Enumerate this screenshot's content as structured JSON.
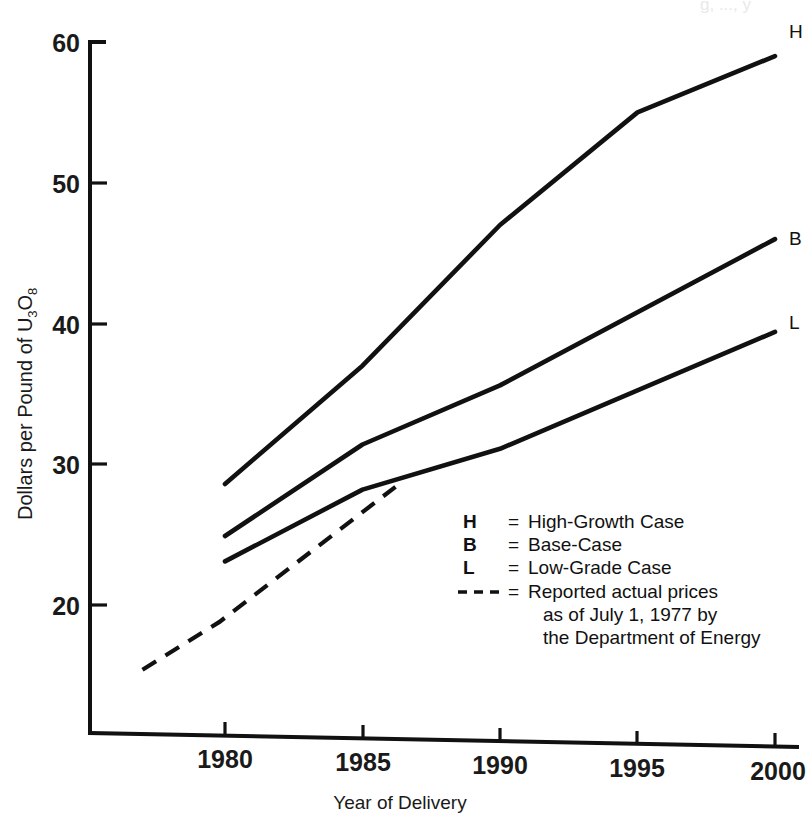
{
  "chart_data": {
    "type": "line",
    "title": "",
    "xlabel": "Year of Delivery",
    "ylabel": "Dollars per Pound of U3O8",
    "ylabel_parts": {
      "prefix": "Dollars per Pound of U",
      "sub1": "3",
      "mid": "O",
      "sub2": "8"
    },
    "xlim": [
      1977,
      2000
    ],
    "ylim": [
      14.5,
      60
    ],
    "xticks": [
      1980,
      1985,
      1990,
      1995,
      2000
    ],
    "xtick_labels": [
      "1980",
      "1985",
      "1990",
      "1995",
      "2000"
    ],
    "yticks": [
      20,
      30,
      40,
      50,
      60
    ],
    "ytick_labels": [
      "20",
      "30",
      "40",
      "50",
      "60"
    ],
    "grid": false,
    "legend_position": "inside-lower-right",
    "series": [
      {
        "name": "H",
        "label": "H",
        "x": [
          1980,
          1985,
          1990,
          1995,
          2000
        ],
        "values": [
          28.6,
          37.0,
          47.0,
          55.0,
          59.0
        ]
      },
      {
        "name": "B",
        "label": "B",
        "x": [
          1980,
          1985,
          1990,
          2000
        ],
        "values": [
          24.9,
          31.4,
          35.6,
          46.0
        ]
      },
      {
        "name": "L",
        "label": "L",
        "x": [
          1980,
          1985,
          1990,
          2000
        ],
        "values": [
          23.1,
          28.2,
          31.1,
          39.4
        ]
      },
      {
        "name": "Reported actual prices",
        "label": "",
        "style": "dashed",
        "x": [
          1977,
          1979.8,
          1986.2
        ],
        "values": [
          15.4,
          18.8,
          28.4
        ]
      }
    ]
  },
  "axes": {
    "ytick_labels": [
      "60",
      "50",
      "40",
      "30",
      "20"
    ],
    "xtick_labels": [
      "1980",
      "1985",
      "1990",
      "1995",
      "2000"
    ],
    "xlabel": "Year of Delivery"
  },
  "series_end_labels": {
    "h": "H",
    "b": "B",
    "l": "L"
  },
  "legend": {
    "rows": [
      {
        "key": "H",
        "eq": "=",
        "text": "High-Growth Case"
      },
      {
        "key": "B",
        "eq": "=",
        "text": "Base-Case"
      },
      {
        "key": "L",
        "eq": "=",
        "text": "Low-Grade Case"
      },
      {
        "key": "dashed-line-icon",
        "eq": "=",
        "text": "Reported actual prices"
      }
    ],
    "continuation": [
      "as of July 1, 1977 by",
      "the Department of Energy"
    ]
  },
  "artifacts": {
    "top_cut_text": "g, ..., y"
  }
}
